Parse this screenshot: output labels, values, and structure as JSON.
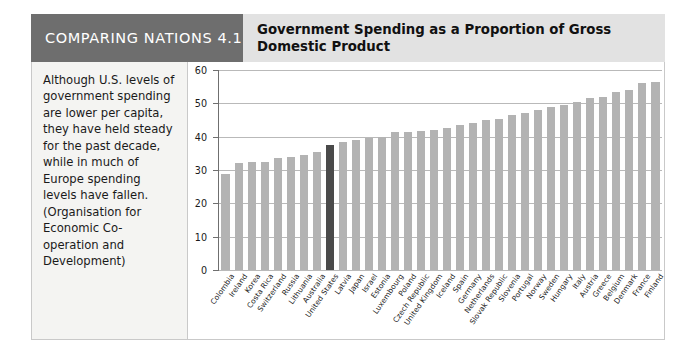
{
  "header": {
    "tag": "COMPARING NATIONS 4.1",
    "title": "Government Spending as a Proportion of Gross Domestic Product",
    "tag_bg": "#6e6e6e",
    "title_bg": "#e2e2e2"
  },
  "note": {
    "text": "Although U.S. levels of government spending are lower per capita, they have held steady for the past decade, while in much of Europe spending levels have fallen. (Organisation for Economic Co-operation and Development)"
  },
  "chart_data": {
    "type": "bar",
    "title": "Government Spending as a Proportion of Gross Domestic Product",
    "xlabel": "",
    "ylabel": "",
    "ylim": [
      0,
      60
    ],
    "yticks": [
      0,
      10,
      20,
      30,
      40,
      50,
      60
    ],
    "grid": true,
    "legend": "none",
    "bar_color": "#b3b3b3",
    "highlight_color": "#4a4a4a",
    "highlight_category": "United States",
    "categories": [
      "Colombia",
      "Ireland",
      "Korea",
      "Costa Rica",
      "Switzerland",
      "Russia",
      "Lithuania",
      "Australia",
      "United States",
      "Latvia",
      "Japan",
      "Israel",
      "Estonia",
      "Luxembourg",
      "Poland",
      "Czech Republic",
      "United Kingdom",
      "Iceland",
      "Spain",
      "Germany",
      "Netherlands",
      "Slovak Republic",
      "Slovenia",
      "Portugal",
      "Norway",
      "Sweden",
      "Hungary",
      "Italy",
      "Austria",
      "Greece",
      "Belgium",
      "Denmark",
      "France",
      "Finland"
    ],
    "values": [
      28.8,
      32.0,
      32.3,
      32.5,
      33.5,
      34.0,
      34.5,
      35.5,
      37.5,
      38.5,
      39.0,
      39.5,
      40.0,
      41.5,
      41.5,
      41.8,
      42.0,
      42.5,
      43.5,
      44.0,
      45.0,
      45.2,
      46.5,
      47.0,
      48.0,
      49.0,
      49.5,
      50.5,
      51.5,
      52.0,
      53.5,
      54.0,
      56.0,
      56.5
    ]
  }
}
